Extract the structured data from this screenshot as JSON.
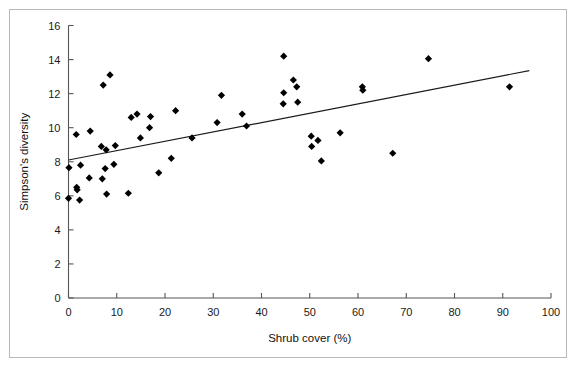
{
  "figure": {
    "background_color": "#ffffff",
    "frame_color": "#b9b9b9",
    "axis_color": "#555555",
    "marker_color": "#000000",
    "trendline_color": "#1a1a1a"
  },
  "chart_data": {
    "type": "scatter",
    "title": "",
    "xlabel": "Shrub cover (%)",
    "ylabel": "Simpson's diversity",
    "xlim": [
      0,
      100
    ],
    "ylim": [
      0,
      16
    ],
    "xticks": [
      0,
      10,
      20,
      30,
      40,
      50,
      60,
      70,
      80,
      90,
      100
    ],
    "yticks": [
      0,
      2,
      4,
      6,
      8,
      10,
      12,
      14,
      16
    ],
    "xtick_labels": [
      "0",
      "10",
      "20",
      "30",
      "40",
      "50",
      "60",
      "70",
      "80",
      "90",
      "100"
    ],
    "ytick_labels": [
      "0",
      "2",
      "4",
      "6",
      "8",
      "10",
      "12",
      "14",
      "16"
    ],
    "grid": false,
    "legend": null,
    "marker_shape": "diamond",
    "points": [
      {
        "x": 0.0,
        "y": 5.85
      },
      {
        "x": 0.1,
        "y": 7.65
      },
      {
        "x": 1.6,
        "y": 9.6
      },
      {
        "x": 1.7,
        "y": 6.5
      },
      {
        "x": 1.8,
        "y": 6.35
      },
      {
        "x": 2.3,
        "y": 5.75
      },
      {
        "x": 2.5,
        "y": 7.8
      },
      {
        "x": 4.5,
        "y": 9.8
      },
      {
        "x": 4.3,
        "y": 7.05
      },
      {
        "x": 6.8,
        "y": 8.9
      },
      {
        "x": 7.0,
        "y": 7.0
      },
      {
        "x": 7.2,
        "y": 12.5
      },
      {
        "x": 7.6,
        "y": 7.6
      },
      {
        "x": 7.8,
        "y": 8.7
      },
      {
        "x": 7.9,
        "y": 6.1
      },
      {
        "x": 8.6,
        "y": 13.1
      },
      {
        "x": 9.4,
        "y": 7.85
      },
      {
        "x": 9.7,
        "y": 8.95
      },
      {
        "x": 12.4,
        "y": 6.15
      },
      {
        "x": 13.0,
        "y": 10.6
      },
      {
        "x": 14.2,
        "y": 10.8
      },
      {
        "x": 14.9,
        "y": 9.4
      },
      {
        "x": 16.8,
        "y": 10.0
      },
      {
        "x": 17.0,
        "y": 10.65
      },
      {
        "x": 18.7,
        "y": 7.35
      },
      {
        "x": 21.3,
        "y": 8.2
      },
      {
        "x": 22.2,
        "y": 11.0
      },
      {
        "x": 25.6,
        "y": 9.4
      },
      {
        "x": 30.8,
        "y": 10.3
      },
      {
        "x": 31.7,
        "y": 11.9
      },
      {
        "x": 36.0,
        "y": 10.8
      },
      {
        "x": 36.9,
        "y": 10.1
      },
      {
        "x": 44.6,
        "y": 14.2
      },
      {
        "x": 44.6,
        "y": 12.05
      },
      {
        "x": 44.5,
        "y": 11.4
      },
      {
        "x": 46.6,
        "y": 12.8
      },
      {
        "x": 47.3,
        "y": 12.4
      },
      {
        "x": 47.5,
        "y": 11.5
      },
      {
        "x": 50.3,
        "y": 9.5
      },
      {
        "x": 50.4,
        "y": 8.9
      },
      {
        "x": 51.7,
        "y": 9.25
      },
      {
        "x": 52.4,
        "y": 8.05
      },
      {
        "x": 56.3,
        "y": 9.7
      },
      {
        "x": 60.9,
        "y": 12.4
      },
      {
        "x": 61.0,
        "y": 12.2
      },
      {
        "x": 67.2,
        "y": 8.5
      },
      {
        "x": 74.6,
        "y": 14.05
      },
      {
        "x": 91.4,
        "y": 12.4
      }
    ],
    "trendline": {
      "x_start": 0,
      "y_start": 8.1,
      "x_end": 95.5,
      "y_end": 13.35
    }
  }
}
